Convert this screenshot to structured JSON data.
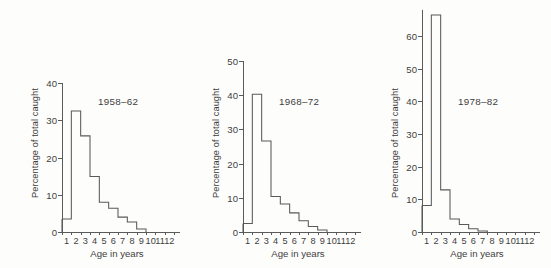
{
  "figure": {
    "background_color": "#fdfdfc",
    "line_color": "#595959",
    "text_color": "#3d3d3d",
    "axis_title_y": "Percentage of total caught",
    "axis_title_x": "Age in years"
  },
  "chart_data": [
    {
      "type": "bar",
      "title": "1958–62",
      "xlabel": "Age in years",
      "ylabel": "Percentage of total caught",
      "categories": [
        "1",
        "2",
        "3",
        "4",
        "5",
        "6",
        "7",
        "8",
        "9",
        "10",
        "11",
        "12"
      ],
      "values": [
        3.5,
        32.5,
        25.8,
        14.9,
        8.0,
        6.4,
        4.0,
        2.7,
        0.8,
        0,
        0,
        0
      ],
      "xlim": [
        0,
        12
      ],
      "ylim": [
        0,
        40
      ],
      "yticks": [
        0,
        10,
        20,
        30,
        40
      ],
      "xticks": [
        "1",
        "2",
        "3",
        "4",
        "5",
        "6",
        "7",
        "8",
        "9",
        "10",
        "11",
        "12"
      ],
      "grid": false,
      "legend": "none"
    },
    {
      "type": "bar",
      "title": "1968–72",
      "xlabel": "Age in years",
      "ylabel": "Percentage of total caught",
      "categories": [
        "1",
        "2",
        "3",
        "4",
        "5",
        "6",
        "7",
        "8",
        "9",
        "10",
        "11",
        "12"
      ],
      "values": [
        2.5,
        40.3,
        26.6,
        10.4,
        8.2,
        5.6,
        3.3,
        1.6,
        0.6,
        0,
        0,
        0
      ],
      "xlim": [
        0,
        12
      ],
      "ylim": [
        0,
        50
      ],
      "yticks": [
        0,
        10,
        20,
        30,
        40,
        50
      ],
      "xticks": [
        "1",
        "2",
        "3",
        "4",
        "5",
        "6",
        "7",
        "8",
        "9",
        "10",
        "11",
        "12"
      ],
      "grid": false,
      "legend": "none"
    },
    {
      "type": "bar",
      "title": "1978–82",
      "xlabel": "Age in years",
      "ylabel": "Percentage of total caught",
      "categories": [
        "1",
        "2",
        "3",
        "4",
        "5",
        "6",
        "7",
        "8",
        "9",
        "10",
        "11",
        "12"
      ],
      "values": [
        8.1,
        66.5,
        12.9,
        4.0,
        2.3,
        1.0,
        0.3,
        0,
        0,
        0,
        0,
        0
      ],
      "xlim": [
        0,
        12
      ],
      "ylim": [
        0,
        68
      ],
      "yticks": [
        0,
        10,
        20,
        30,
        40,
        50,
        60
      ],
      "xticks": [
        "1",
        "2",
        "3",
        "4",
        "5",
        "6",
        "7",
        "8",
        "9",
        "10",
        "11",
        "12"
      ],
      "grid": false,
      "legend": "none"
    }
  ]
}
